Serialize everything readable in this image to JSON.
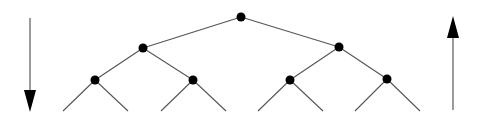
{
  "diagram": {
    "type": "binary-tree",
    "colors": {
      "edge": "#555555",
      "node": "#000000",
      "arrow": "#000000",
      "arrow_shaft": "#666666",
      "background": "#ffffff"
    },
    "nodes": [
      {
        "id": "root",
        "x": 241,
        "y": 17
      },
      {
        "id": "l1",
        "x": 143,
        "y": 48
      },
      {
        "id": "r1",
        "x": 339,
        "y": 47
      },
      {
        "id": "ll",
        "x": 95,
        "y": 80
      },
      {
        "id": "lr",
        "x": 193,
        "y": 80
      },
      {
        "id": "rl",
        "x": 290,
        "y": 80
      },
      {
        "id": "rr",
        "x": 387,
        "y": 79
      }
    ],
    "edges": [
      {
        "from": "root",
        "to": "l1"
      },
      {
        "from": "root",
        "to": "r1"
      },
      {
        "from": "l1",
        "to": "ll"
      },
      {
        "from": "l1",
        "to": "lr"
      },
      {
        "from": "r1",
        "to": "rl"
      },
      {
        "from": "r1",
        "to": "rr"
      }
    ],
    "leaf_stubs": [
      {
        "x1": 95,
        "y1": 80,
        "x2": 63,
        "y2": 111
      },
      {
        "x1": 95,
        "y1": 80,
        "x2": 128,
        "y2": 111
      },
      {
        "x1": 193,
        "y1": 80,
        "x2": 161,
        "y2": 111
      },
      {
        "x1": 193,
        "y1": 80,
        "x2": 226,
        "y2": 111
      },
      {
        "x1": 290,
        "y1": 80,
        "x2": 258,
        "y2": 111
      },
      {
        "x1": 290,
        "y1": 80,
        "x2": 323,
        "y2": 111
      },
      {
        "x1": 387,
        "y1": 79,
        "x2": 355,
        "y2": 111
      },
      {
        "x1": 387,
        "y1": 79,
        "x2": 420,
        "y2": 111
      }
    ],
    "arrows": [
      {
        "id": "down-arrow",
        "direction": "down",
        "x": 30,
        "y_start": 18,
        "y_end": 112
      },
      {
        "id": "up-arrow",
        "direction": "up",
        "x": 453,
        "y_start": 110,
        "y_end": 16
      }
    ],
    "node_radius": 4.5
  }
}
